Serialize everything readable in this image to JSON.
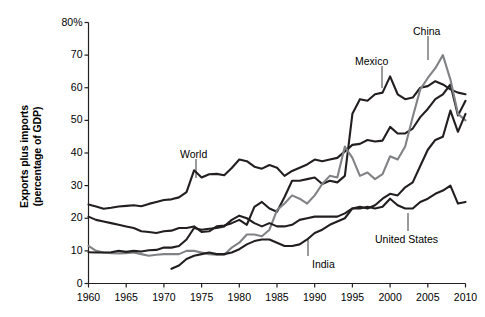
{
  "chart_data": {
    "type": "line",
    "title": "",
    "subtitle": "",
    "xlabel": "",
    "ylabel": "Exports plus imports\n(percentage of GDP)",
    "xlim": [
      1960,
      2010
    ],
    "ylim": [
      0,
      80
    ],
    "grid": false,
    "legend_position": "inline-annotations",
    "x_ticks": [
      "1960",
      "1965",
      "1970",
      "1975",
      "1980",
      "1985",
      "1990",
      "1995",
      "2000",
      "2005",
      "2010"
    ],
    "x_tick_values": [
      1960,
      1965,
      1970,
      1975,
      1980,
      1985,
      1990,
      1995,
      2000,
      2005,
      2010
    ],
    "y_ticks": [
      "0",
      "10",
      "20",
      "30",
      "40",
      "50",
      "60",
      "70",
      "80%"
    ],
    "y_tick_values": [
      0,
      10,
      20,
      30,
      40,
      50,
      60,
      70,
      80
    ],
    "colors": {
      "dark": "#231f20",
      "grey": "#808285",
      "axis": "#231f20",
      "background": "#ffffff"
    },
    "series": [
      {
        "name": "World",
        "color": "#231f20",
        "label_text": "World",
        "label_x": 180,
        "label_y": 148,
        "leader_to_x": 196,
        "leader_to_y": 178,
        "x": [
          1960,
          1961,
          1962,
          1963,
          1964,
          1965,
          1966,
          1967,
          1968,
          1969,
          1970,
          1971,
          1972,
          1973,
          1974,
          1975,
          1976,
          1977,
          1978,
          1979,
          1980,
          1981,
          1982,
          1983,
          1984,
          1985,
          1986,
          1987,
          1988,
          1989,
          1990,
          1991,
          1992,
          1993,
          1994,
          1995,
          1996,
          1997,
          1998,
          1999,
          2000,
          2001,
          2002,
          2003,
          2004,
          2005,
          2006,
          2007,
          2008,
          2009,
          2010
        ],
        "values": [
          24.2,
          23.6,
          22.9,
          23.2,
          23.6,
          23.8,
          24.0,
          23.7,
          24.4,
          25.0,
          25.6,
          25.8,
          26.4,
          28.0,
          34.7,
          32.5,
          33.5,
          33.6,
          33.2,
          35.4,
          38.0,
          37.5,
          35.8,
          35.2,
          36.3,
          35.5,
          33.0,
          34.5,
          35.5,
          36.5,
          38.0,
          37.5,
          38.0,
          38.5,
          40.5,
          42.5,
          42.8,
          44.0,
          43.5,
          43.8,
          48.0,
          46.0,
          46.0,
          47.5,
          51.0,
          53.5,
          56.5,
          58.0,
          61.0,
          51.5,
          56.0
        ]
      },
      {
        "name": "Mexico",
        "color": "#231f20",
        "label_text": "Mexico",
        "label_x": 355,
        "label_y": 55,
        "leader_to_x": 382,
        "leader_to_y": 88,
        "x": [
          1960,
          1961,
          1962,
          1963,
          1964,
          1965,
          1966,
          1967,
          1968,
          1969,
          1970,
          1971,
          1972,
          1973,
          1974,
          1975,
          1976,
          1977,
          1978,
          1979,
          1980,
          1981,
          1982,
          1983,
          1984,
          1985,
          1986,
          1987,
          1988,
          1989,
          1990,
          1991,
          1992,
          1993,
          1994,
          1995,
          1996,
          1997,
          1998,
          1999,
          2000,
          2001,
          2002,
          2003,
          2004,
          2005,
          2006,
          2007,
          2008,
          2009,
          2010
        ],
        "values": [
          20.5,
          19.5,
          19.0,
          18.5,
          18.0,
          17.5,
          17.0,
          16.0,
          15.8,
          15.5,
          16.0,
          16.2,
          17.0,
          17.0,
          17.5,
          15.8,
          16.0,
          17.5,
          17.8,
          18.5,
          19.5,
          18.0,
          23.5,
          25.0,
          23.0,
          22.0,
          26.5,
          31.5,
          31.5,
          32.0,
          32.5,
          30.5,
          31.5,
          31.0,
          33.0,
          52.0,
          56.5,
          56.0,
          58.0,
          58.5,
          63.5,
          58.0,
          56.5,
          57.0,
          60.0,
          60.5,
          62.0,
          61.0,
          59.5,
          58.5,
          58.0
        ]
      },
      {
        "name": "China",
        "color": "#808285",
        "label_text": "China",
        "label_x": 413,
        "label_y": 25,
        "leader_to_x": 428,
        "leader_to_y": 60,
        "x": [
          1960,
          1961,
          1962,
          1963,
          1964,
          1965,
          1966,
          1967,
          1968,
          1969,
          1970,
          1971,
          1972,
          1973,
          1974,
          1975,
          1976,
          1977,
          1978,
          1979,
          1980,
          1981,
          1982,
          1983,
          1984,
          1985,
          1986,
          1987,
          1988,
          1989,
          1990,
          1991,
          1992,
          1993,
          1994,
          1995,
          1996,
          1997,
          1998,
          1999,
          2000,
          2001,
          2002,
          2003,
          2004,
          2005,
          2006,
          2007,
          2008,
          2009,
          2010
        ],
        "values": [
          11.5,
          10.0,
          9.5,
          9.3,
          9.2,
          9.3,
          9.5,
          9.0,
          8.5,
          8.8,
          9.0,
          9.0,
          9.0,
          10.0,
          10.0,
          9.5,
          9.0,
          8.8,
          8.8,
          11.0,
          12.5,
          15.0,
          15.0,
          14.5,
          16.5,
          22.5,
          24.5,
          27.0,
          26.0,
          24.5,
          27.0,
          30.5,
          33.0,
          32.5,
          42.0,
          38.5,
          33.0,
          34.0,
          32.0,
          33.5,
          39.0,
          38.0,
          42.0,
          51.0,
          59.5,
          63.0,
          66.0,
          70.0,
          62.5,
          52.0,
          50.0
        ]
      },
      {
        "name": "India",
        "color": "#231f20",
        "label_text": "India",
        "label_x": 312,
        "label_y": 258,
        "leader_to_x": 308,
        "leader_to_y": 238,
        "x": [
          1971,
          1972,
          1973,
          1974,
          1975,
          1976,
          1977,
          1978,
          1979,
          1980,
          1981,
          1982,
          1983,
          1984,
          1985,
          1986,
          1987,
          1988,
          1989,
          1990,
          1991,
          1992,
          1993,
          1994,
          1995,
          1996,
          1997,
          1998,
          1999,
          2000,
          2001,
          2002,
          2003,
          2004,
          2005,
          2006,
          2007,
          2008,
          2009,
          2010
        ],
        "values": [
          4.5,
          5.5,
          7.5,
          8.5,
          9.0,
          9.5,
          9.0,
          9.0,
          9.5,
          10.5,
          12.0,
          13.0,
          13.5,
          13.5,
          12.5,
          11.5,
          11.5,
          12.0,
          13.5,
          15.5,
          16.5,
          18.0,
          19.0,
          20.0,
          23.0,
          23.5,
          23.0,
          24.0,
          26.0,
          27.5,
          27.0,
          29.5,
          31.0,
          36.0,
          41.0,
          44.0,
          45.0,
          53.0,
          46.5,
          52.0
        ]
      },
      {
        "name": "United States",
        "color": "#231f20",
        "label_text": "United States",
        "label_x": 375,
        "label_y": 233,
        "leader_to_x": 408,
        "leader_to_y": 213,
        "x": [
          1960,
          1961,
          1962,
          1963,
          1964,
          1965,
          1966,
          1967,
          1968,
          1969,
          1970,
          1971,
          1972,
          1973,
          1974,
          1975,
          1976,
          1977,
          1978,
          1979,
          1980,
          1981,
          1982,
          1983,
          1984,
          1985,
          1986,
          1987,
          1988,
          1989,
          1990,
          1991,
          1992,
          1993,
          1994,
          1995,
          1996,
          1997,
          1998,
          1999,
          2000,
          2001,
          2002,
          2003,
          2004,
          2005,
          2006,
          2007,
          2008,
          2009,
          2010
        ],
        "values": [
          9.6,
          9.5,
          9.5,
          9.6,
          10.0,
          9.7,
          10.0,
          9.8,
          10.2,
          10.3,
          11.0,
          11.0,
          11.5,
          13.5,
          17.0,
          16.5,
          16.8,
          17.0,
          17.5,
          19.5,
          20.8,
          20.0,
          18.5,
          17.5,
          18.5,
          17.5,
          17.5,
          18.0,
          19.5,
          20.0,
          20.5,
          20.5,
          20.5,
          20.5,
          21.5,
          23.0,
          23.0,
          23.5,
          23.0,
          23.5,
          26.0,
          24.0,
          23.0,
          23.0,
          25.0,
          26.0,
          27.5,
          28.5,
          30.0,
          24.5,
          25.0
        ]
      }
    ]
  },
  "axis": {
    "y_label_line1": "Exports plus imports",
    "y_label_line2": "(percentage of GDP)"
  }
}
